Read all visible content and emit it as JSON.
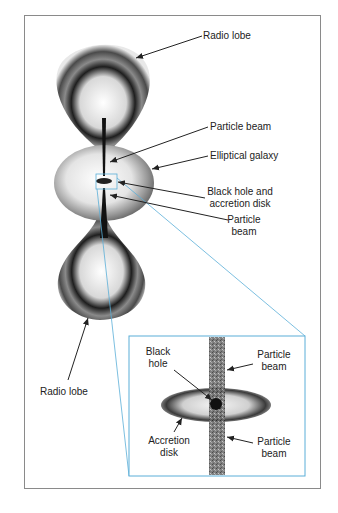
{
  "diagram": {
    "labels": {
      "radio_lobe_top": "Radio lobe",
      "particle_beam_top": "Particle beam",
      "elliptical_galaxy": "Elliptical galaxy",
      "black_hole_line1": "Black hole and",
      "black_hole_line2": "accretion disk",
      "particle_beam_mid_line1": "Particle",
      "particle_beam_mid_line2": "beam",
      "radio_lobe_bottom": "Radio lobe"
    },
    "inset": {
      "labels": {
        "black_hole_line1": "Black",
        "black_hole_line2": "hole",
        "particle_beam_top_line1": "Particle",
        "particle_beam_top_line2": "beam",
        "accretion_line1": "Accretion",
        "accretion_line2": "disk",
        "particle_beam_bottom_line1": "Particle",
        "particle_beam_bottom_line2": "beam"
      }
    },
    "colors": {
      "frame": "#8a8a8a",
      "zoom_lines": "#5aaed8",
      "ink": "#222222"
    }
  }
}
